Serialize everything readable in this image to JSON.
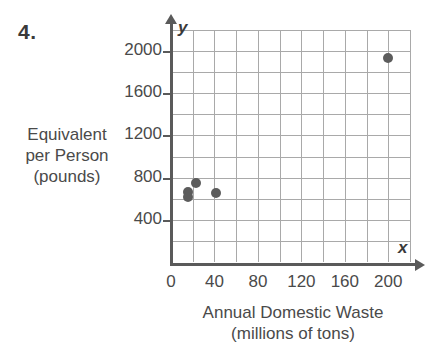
{
  "problem": {
    "number": "4."
  },
  "chart_data": {
    "type": "scatter",
    "title": "",
    "xlabel": "Annual Domestic Waste",
    "xlabel_units": "(millions of tons)",
    "ylabel": "Equivalent",
    "ylabel_line2": "per Person",
    "ylabel_units": "(pounds)",
    "x_axis_name": "x",
    "y_axis_name": "y",
    "xlim": [
      0,
      220
    ],
    "ylim": [
      0,
      2200
    ],
    "x_ticks": [
      0,
      40,
      80,
      120,
      160,
      200
    ],
    "x_tick_labels": [
      "0",
      "40",
      "80",
      "120",
      "160",
      "200"
    ],
    "y_ticks": [
      400,
      800,
      1200,
      1600,
      2000
    ],
    "y_tick_labels": [
      "400",
      "800",
      "1200",
      "1600",
      "2000"
    ],
    "x_grid_step": 20,
    "y_grid_step": 200,
    "grid": true,
    "legend": false,
    "point_color": "#5c5c5c",
    "grid_color": "#a9a9a9",
    "axis_color": "#5a5a5a",
    "points": [
      {
        "x": 16,
        "y": 660
      },
      {
        "x": 16,
        "y": 615
      },
      {
        "x": 23,
        "y": 750
      },
      {
        "x": 41,
        "y": 650
      },
      {
        "x": 200,
        "y": 1930
      }
    ]
  }
}
